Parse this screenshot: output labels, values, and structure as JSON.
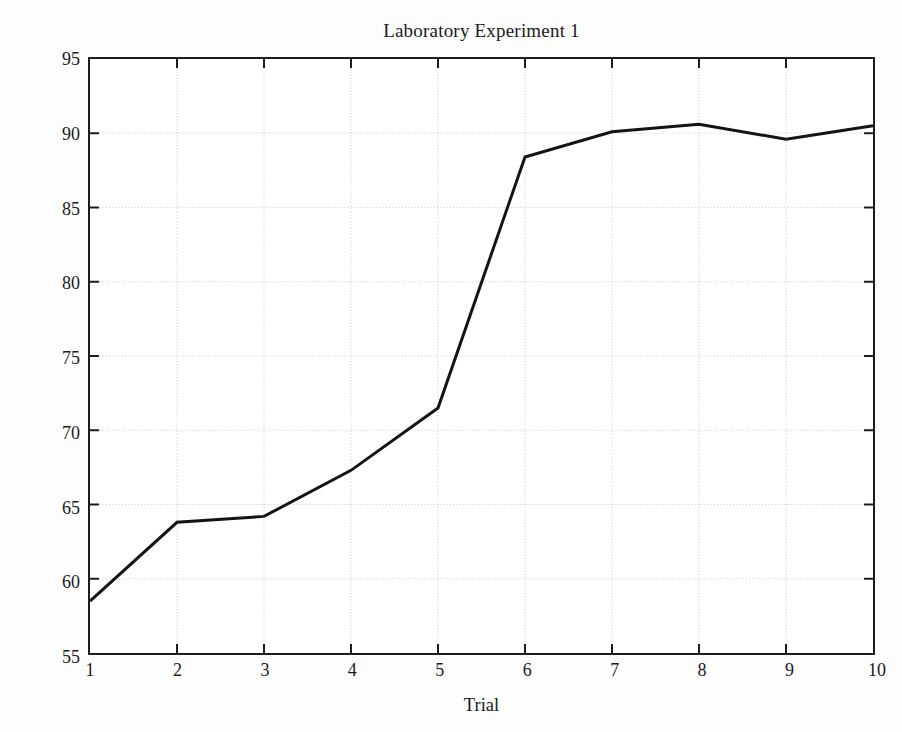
{
  "chart_data": {
    "type": "line",
    "title": "Laboratory Experiment 1",
    "xlabel": "Trial",
    "ylabel": "Distance, ft",
    "x": [
      1,
      2,
      3,
      4,
      5,
      6,
      7,
      8,
      9,
      10
    ],
    "values": [
      58.5,
      63.8,
      64.2,
      67.3,
      71.5,
      88.4,
      90.1,
      90.6,
      89.6,
      90.5
    ],
    "categories": [
      "1",
      "2",
      "3",
      "4",
      "5",
      "6",
      "7",
      "8",
      "9",
      "10"
    ],
    "xlim": [
      1,
      10
    ],
    "ylim": [
      55,
      95
    ],
    "xticks": [
      1,
      2,
      3,
      4,
      5,
      6,
      7,
      8,
      9,
      10
    ],
    "xtick_labels": [
      "1",
      "2",
      "3",
      "4",
      "5",
      "6",
      "7",
      "8",
      "9",
      "10"
    ],
    "yticks": [
      55,
      60,
      65,
      70,
      75,
      80,
      85,
      90,
      95
    ],
    "ytick_labels": [
      "55",
      "60",
      "65",
      "70",
      "75",
      "80",
      "85",
      "90",
      "95"
    ],
    "grid": true,
    "grid_style": "dotted",
    "grid_color": "#c9c9c9",
    "legend": null,
    "legend_position": "none",
    "series": [
      {
        "name": "Distance",
        "color": "#141414",
        "line_width": 3,
        "marker": "none",
        "values": [
          58.5,
          63.8,
          64.2,
          67.3,
          71.5,
          88.4,
          90.1,
          90.6,
          89.6,
          90.5
        ]
      }
    ],
    "annotations": []
  },
  "figure": {
    "background_color": "#fdfdfd",
    "plot_background_color": "#ffffff",
    "axis_color": "#1c1c1c"
  }
}
